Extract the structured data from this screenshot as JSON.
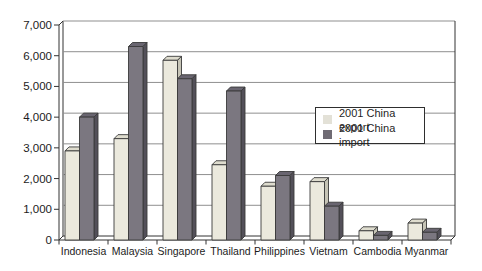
{
  "figure": {
    "background": "#ffffff"
  },
  "chart_data": {
    "type": "bar",
    "title": "",
    "xlabel": "",
    "ylabel": "",
    "categories": [
      "Indonesia",
      "Malaysia",
      "Singapore",
      "Thailand",
      "Philippines",
      "Vietnam",
      "Cambodia",
      "Myanmar"
    ],
    "series": [
      {
        "name": "2001 China export",
        "values": [
          2900,
          3300,
          5850,
          2450,
          1750,
          1900,
          300,
          550
        ]
      },
      {
        "name": "2001 China import",
        "values": [
          4000,
          6300,
          5250,
          4850,
          2100,
          1100,
          150,
          250
        ]
      }
    ],
    "ylim": [
      0,
      7000
    ],
    "ytick_interval": 1000,
    "ytick_labels": [
      "0",
      "1,000",
      "2,000",
      "3,000",
      "4,000",
      "5,000",
      "6,000",
      "7,000"
    ],
    "grid": true,
    "style": "3d-bar",
    "legend_position": "middle-right",
    "colors": {
      "export_front": "#ebe9dd",
      "export_top": "#dedcce",
      "export_side": "#c6c4b6",
      "import_front": "#7b7780",
      "import_top": "#696570",
      "import_side": "#535059",
      "outline": "#3a3a3a",
      "gridline": "#8f8f8f",
      "axis": "#333333",
      "text": "#1c1c1c",
      "legend_export_swatch": "#e3e1d7",
      "legend_import_swatch": "#6f6b74"
    }
  }
}
